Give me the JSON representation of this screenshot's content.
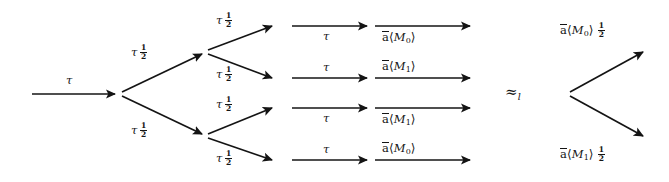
{
  "figure": {
    "kind": "probabilistic-transition-tree-equivalence",
    "relation_symbol": "≈",
    "relation_subscript": "l",
    "symbols": {
      "tau": "τ",
      "half_numerator": "1",
      "half_denominator": "2",
      "output_prefix": "a",
      "angle_open": "⟨",
      "angle_close": "⟩"
    },
    "left_tree": {
      "root_edge": {
        "label": "τ"
      },
      "level1": [
        {
          "label": "τ",
          "prob_num": "1",
          "prob_den": "2"
        },
        {
          "label": "τ",
          "prob_num": "1",
          "prob_den": "2"
        }
      ],
      "level2": [
        {
          "label": "τ",
          "prob_num": "1",
          "prob_den": "2"
        },
        {
          "label": "τ",
          "prob_num": "1",
          "prob_den": "2"
        },
        {
          "label": "τ",
          "prob_num": "1",
          "prob_den": "2"
        },
        {
          "label": "τ",
          "prob_num": "1",
          "prob_den": "2"
        }
      ],
      "level3": [
        {
          "label": "τ"
        },
        {
          "label": "τ"
        },
        {
          "label": "τ"
        },
        {
          "label": "τ"
        }
      ],
      "level4": [
        {
          "action": "a",
          "message": "M",
          "index": "0"
        },
        {
          "action": "a",
          "message": "M",
          "index": "1"
        },
        {
          "action": "a",
          "message": "M",
          "index": "1"
        },
        {
          "action": "a",
          "message": "M",
          "index": "0"
        }
      ]
    },
    "right_tree": {
      "branches": [
        {
          "action": "a",
          "message": "M",
          "index": "0",
          "prob_num": "1",
          "prob_den": "2"
        },
        {
          "action": "a",
          "message": "M",
          "index": "1",
          "prob_num": "1",
          "prob_den": "2"
        }
      ]
    },
    "colors": {
      "ink": "#141414",
      "background": "#ffffff"
    }
  }
}
